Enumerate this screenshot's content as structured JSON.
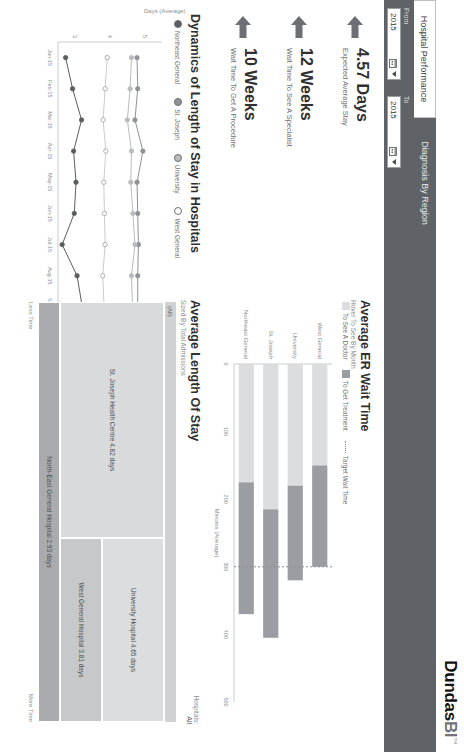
{
  "app": {
    "logo_name": "Dundas",
    "logo_mark": "BI",
    "logo_tm": "™"
  },
  "tabs": [
    {
      "label": "Hospital Performance",
      "active": true
    },
    {
      "label": "Diagnosis By Region",
      "active": false
    }
  ],
  "filters": {
    "from_label": "From",
    "from_value": "2015",
    "to_label": "To",
    "to_value": "2015"
  },
  "kpis": [
    {
      "value": "4.57 Days",
      "label": "Expected Average Stay",
      "icon": "arrow-left-icon"
    },
    {
      "value": "12 Weeks",
      "label": "Wait Time To See A Specialist",
      "icon": "arrow-left-icon"
    },
    {
      "value": "10 Weeks",
      "label": "Wait Time To Get A Procedure",
      "icon": "arrow-left-icon"
    }
  ],
  "line_panel": {
    "title": "Dynamics of Length of Stay in Hospitals",
    "ylabel": "Days (Average)"
  },
  "er_panel": {
    "title": "Average ER Wait Time",
    "subtitle": "Hover To See By Month",
    "xlabel": "Minutes (Average)"
  },
  "treemap_panel": {
    "title": "Average Length Of Stay",
    "subtitle": "Sized By Total Admissions",
    "filter_label": "Hospitals:",
    "filter_value": "All",
    "group_label": "(All)",
    "scale_low": "Less Time",
    "scale_high": "More Time",
    "tiles": [
      {
        "label": "St. Joseph Health Centre 4.82 days",
        "value": 4.82,
        "color": "#d9dadc"
      },
      {
        "label": "University Hospital 4.65 days",
        "value": 4.65,
        "color": "#dcddde"
      },
      {
        "label": "West General Hospital 3.81 days",
        "value": 3.81,
        "color": "#c6c8ca"
      },
      {
        "label": "North-East General Hospital 2.93 days",
        "value": 2.93,
        "color": "#a9abae"
      }
    ]
  },
  "colors": {
    "toolbar": "#5f6368",
    "series_northeast": "#5a5d61",
    "series_stjoseph": "#8e9195",
    "series_university": "#b9bbbe",
    "series_westgeneral": "#ffffff",
    "bar_doctor": "#dcdddf",
    "bar_treatment": "#9a9da1",
    "target_line": "#8b8e92"
  },
  "chart_data": [
    {
      "type": "line",
      "title": "Dynamics of Length of Stay in Hospitals",
      "xlabel": "",
      "ylabel": "Days (Average)",
      "ylim": [
        2.5,
        5.5
      ],
      "yticks": [
        3,
        4,
        5
      ],
      "grid": false,
      "legend_position": "top",
      "categories": [
        "Jan-15",
        "Feb-15",
        "Mar-15",
        "Apr-15",
        "May-15",
        "Jun-15",
        "Jul-15",
        "Aug-15",
        "Sep-15",
        "Oct-15",
        "Nov-15",
        "Dec-15"
      ],
      "series": [
        {
          "name": "Northeast General",
          "values": [
            2.72,
            2.92,
            3.18,
            2.95,
            3.02,
            2.97,
            2.62,
            3.05,
            3.2,
            3.3,
            3.08,
            3.22
          ]
        },
        {
          "name": "St. Joseph",
          "values": [
            4.78,
            4.8,
            4.72,
            4.95,
            4.78,
            4.8,
            4.82,
            4.8,
            4.8,
            4.84,
            4.82,
            4.86
          ]
        },
        {
          "name": "University",
          "values": [
            4.62,
            4.58,
            4.5,
            4.62,
            4.6,
            4.66,
            4.72,
            4.62,
            4.65,
            4.68,
            4.64,
            4.66
          ]
        },
        {
          "name": "West General",
          "values": [
            3.92,
            3.86,
            3.8,
            3.88,
            3.82,
            3.84,
            3.86,
            3.79,
            3.83,
            3.86,
            3.88,
            3.84
          ]
        }
      ]
    },
    {
      "type": "bar",
      "title": "Average ER Wait Time",
      "subtitle": "Hover To See By Month",
      "orientation": "horizontal",
      "xlabel": "Minutes (Average)",
      "ylabel": "",
      "xlim": [
        0,
        500
      ],
      "xticks": [
        0,
        100,
        200,
        300,
        400,
        500
      ],
      "grid": false,
      "legend_position": "top",
      "categories": [
        "West General",
        "University",
        "St. Joseph",
        "Northeast General"
      ],
      "series": [
        {
          "name": "To See A Doctor",
          "values": [
            150,
            180,
            215,
            175
          ]
        },
        {
          "name": "To Get Treatment",
          "values": [
            150,
            140,
            190,
            195
          ]
        }
      ],
      "reference_line": {
        "name": "Target Wait Time",
        "value": 300
      }
    },
    {
      "type": "treemap",
      "title": "Average Length Of Stay",
      "subtitle": "Sized By Total Admissions",
      "group": "(All)",
      "categories": [
        "St. Joseph Health Centre",
        "University Hospital",
        "West General Hospital",
        "North-East General Hospital"
      ],
      "values": [
        4.82,
        4.65,
        3.81,
        2.93
      ],
      "value_unit": "days",
      "scale": [
        "Less Time",
        "More Time"
      ]
    }
  ]
}
